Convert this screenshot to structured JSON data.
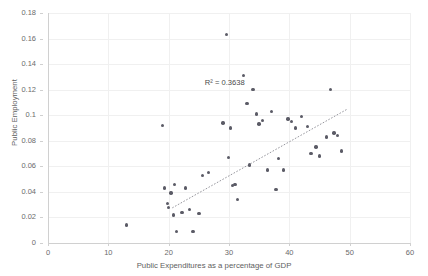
{
  "chart_data": {
    "type": "scatter",
    "title": "",
    "xlabel": "Public Expenditures as a percentage of GDP",
    "ylabel": "Public Employment",
    "xlim": [
      0,
      60
    ],
    "ylim": [
      0,
      0.18
    ],
    "xticks": [
      "0",
      "10",
      "20",
      "30",
      "40",
      "50",
      "60"
    ],
    "xtick_values": [
      0,
      10,
      20,
      30,
      40,
      50,
      60
    ],
    "yticks": [
      "0",
      "0.02",
      "0.04",
      "0.06",
      "0.08",
      "0.1",
      "0.12",
      "0.14",
      "0.16",
      "0.18"
    ],
    "ytick_values": [
      0,
      0.02,
      0.04,
      0.06,
      0.08,
      0.1,
      0.12,
      0.14,
      0.16,
      0.18
    ],
    "grid": true,
    "legend": "none",
    "annotations": [
      {
        "text": "R² = 0.3638",
        "x": 26.0,
        "y": 0.125
      }
    ],
    "series": [
      {
        "name": "Countries",
        "marker_color": "#5b5b66",
        "points": [
          [
            13.0,
            0.014
          ],
          [
            19.0,
            0.092
          ],
          [
            19.3,
            0.043
          ],
          [
            19.8,
            0.031
          ],
          [
            20.0,
            0.028
          ],
          [
            20.4,
            0.039
          ],
          [
            20.8,
            0.022
          ],
          [
            21.0,
            0.046
          ],
          [
            21.3,
            0.009
          ],
          [
            22.2,
            0.024
          ],
          [
            22.8,
            0.043
          ],
          [
            23.5,
            0.026
          ],
          [
            24.0,
            0.009
          ],
          [
            25.0,
            0.023
          ],
          [
            25.6,
            0.053
          ],
          [
            26.6,
            0.055
          ],
          [
            29.0,
            0.094
          ],
          [
            29.6,
            0.163
          ],
          [
            29.9,
            0.067
          ],
          [
            30.2,
            0.09
          ],
          [
            30.6,
            0.045
          ],
          [
            31.0,
            0.046
          ],
          [
            31.4,
            0.034
          ],
          [
            32.4,
            0.131
          ],
          [
            33.0,
            0.109
          ],
          [
            33.4,
            0.061
          ],
          [
            34.0,
            0.12
          ],
          [
            34.6,
            0.101
          ],
          [
            35.0,
            0.093
          ],
          [
            35.6,
            0.096
          ],
          [
            36.4,
            0.057
          ],
          [
            37.0,
            0.103
          ],
          [
            37.8,
            0.042
          ],
          [
            38.2,
            0.066
          ],
          [
            39.0,
            0.057
          ],
          [
            39.8,
            0.097
          ],
          [
            40.4,
            0.095
          ],
          [
            41.0,
            0.09
          ],
          [
            42.0,
            0.099
          ],
          [
            43.0,
            0.091
          ],
          [
            43.6,
            0.07
          ],
          [
            44.4,
            0.075
          ],
          [
            45.0,
            0.068
          ],
          [
            46.2,
            0.083
          ],
          [
            46.8,
            0.12
          ],
          [
            47.4,
            0.086
          ],
          [
            48.0,
            0.084
          ],
          [
            48.6,
            0.072
          ]
        ]
      }
    ],
    "trendline": {
      "type": "linear",
      "style": "dotted",
      "color": "#8a8a92",
      "r_squared": 0.3638,
      "x_start": 20.6,
      "y_start": 0.0275,
      "x_end": 49.5,
      "y_end": 0.1045
    }
  }
}
